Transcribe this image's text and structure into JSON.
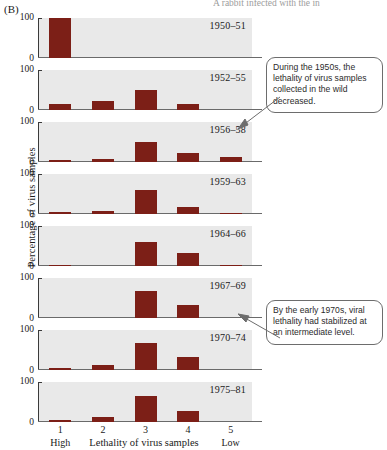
{
  "figure": {
    "panel_letter": "(B)",
    "top_caption_clipped": "A rabbit infected with the in",
    "y_axis_title": "Percentage of virus samples",
    "x_axis_title": "Lethality of virus samples",
    "x_end_labels": {
      "left": "High",
      "right": "Low"
    },
    "tick_labels": {
      "top": "100",
      "bottom": "0"
    },
    "bar_color": "#7c1f17",
    "plot_background": "#e9e9e9"
  },
  "callouts": [
    {
      "id": "callout-1",
      "text": "During the 1950s, the lethality of virus samples collected in the wild decreased."
    },
    {
      "id": "callout-2",
      "text": "By the early 1970s, viral lethality had stabilized at an intermediate level."
    }
  ],
  "chart_data": {
    "type": "bar",
    "xlabel": "Lethality of virus samples",
    "ylabel": "Percentage of virus samples",
    "ylim": [
      0,
      100
    ],
    "yticks": [
      0,
      100
    ],
    "categories": [
      "1",
      "2",
      "3",
      "4",
      "5"
    ],
    "category_endpoints": [
      "High",
      "Low"
    ],
    "grid": false,
    "legend": "none",
    "panels": [
      {
        "period": "1950–51",
        "values": [
          100,
          0,
          0,
          0,
          0
        ]
      },
      {
        "period": "1952–55",
        "values": [
          15,
          22,
          50,
          14,
          0
        ]
      },
      {
        "period": "1956–58",
        "values": [
          5,
          7,
          50,
          22,
          12
        ]
      },
      {
        "period": "1959–63",
        "values": [
          4,
          8,
          60,
          18,
          3
        ]
      },
      {
        "period": "1964–66",
        "values": [
          3,
          0,
          60,
          32,
          3
        ]
      },
      {
        "period": "1967–69",
        "values": [
          0,
          0,
          67,
          32,
          0
        ]
      },
      {
        "period": "1970–74",
        "values": [
          6,
          12,
          67,
          32,
          0
        ]
      },
      {
        "period": "1975–81",
        "values": [
          6,
          12,
          65,
          28,
          0
        ]
      }
    ]
  }
}
